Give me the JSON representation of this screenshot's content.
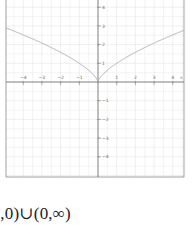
{
  "chart_data": {
    "type": "line",
    "title": "",
    "xlabel": "x",
    "ylabel": "",
    "xlim": [
      -5.2,
      4.7
    ],
    "ylim": [
      -5.1,
      4.4
    ],
    "xticks": [
      -4,
      -3,
      -2,
      -1,
      1,
      2,
      3,
      4
    ],
    "yticks": [
      -4,
      -3,
      -2,
      -1,
      1,
      2,
      3,
      4
    ],
    "grid": true,
    "legend": null,
    "series": [
      {
        "name": "y = x^(2/3)",
        "x": [
          -4.9,
          -4,
          -3,
          -2,
          -1,
          -0.5,
          -0.1,
          0,
          0.1,
          0.5,
          1,
          2,
          3,
          4,
          4.6
        ],
        "values": [
          2.88,
          2.52,
          2.08,
          1.59,
          1.0,
          0.63,
          0.22,
          0,
          0.22,
          0.63,
          1.0,
          1.59,
          2.08,
          2.52,
          2.77
        ]
      }
    ]
  },
  "colors": {
    "grid": "#e4e4e4",
    "axis": "#555555",
    "curve": "#b0b0b0",
    "frame": "#8a8a8a"
  },
  "answer_text": "∞,0)∪(0,∞)"
}
